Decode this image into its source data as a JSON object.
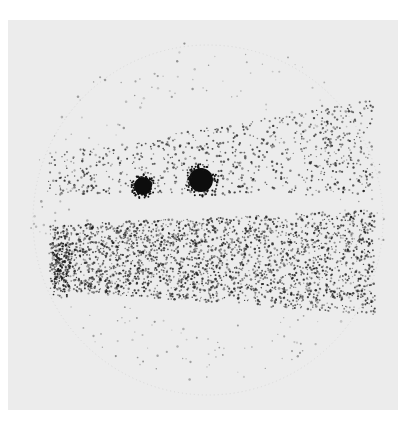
{
  "page": {
    "header": {
      "running_title": "",
      "page_number": ""
    }
  },
  "figure": {
    "type": "scintigram",
    "background_color": "#ececec",
    "dot_color": "#1a1a1a",
    "hot_spots": [
      {
        "label": "spot-left",
        "cx": 143,
        "cy": 186,
        "r": 9
      },
      {
        "label": "spot-right",
        "cx": 201,
        "cy": 180,
        "r": 12
      }
    ],
    "bands": [
      {
        "label": "upper-band",
        "density": "moderate"
      },
      {
        "label": "lower-band",
        "density": "high"
      }
    ]
  }
}
